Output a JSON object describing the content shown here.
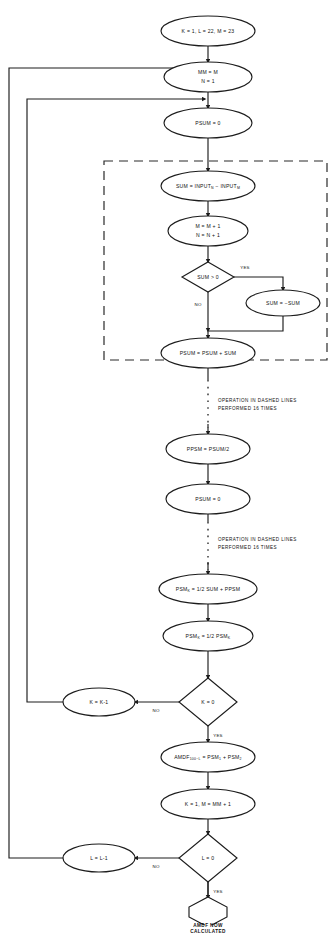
{
  "diagram": {
    "kind": "flowchart",
    "colors": {
      "stroke": "#1c1c1c",
      "fill": "#ffffff",
      "background": "#ffffff"
    },
    "nodes": {
      "init": {
        "shape": "ellipse",
        "line1": "K = 1,  L = 22,  M = 23"
      },
      "mm_set": {
        "shape": "ellipse",
        "line1": "MM = M",
        "line2": "N = 1"
      },
      "psum_zero_1": {
        "shape": "ellipse",
        "line1": "PSUM = 0"
      },
      "sum_input": {
        "shape": "ellipse",
        "pre": "SUM = INPUT",
        "sub1": "N",
        "mid": " − INPUT",
        "sub2": "M"
      },
      "incr": {
        "shape": "ellipse",
        "line1": "M = M + 1",
        "line2": "N = N + 1"
      },
      "sum_test": {
        "shape": "diamond",
        "line1": "SUM > 0"
      },
      "sum_neg": {
        "shape": "ellipse",
        "line1": "SUM = −SUM"
      },
      "psum_acc": {
        "shape": "ellipse",
        "line1": "PSUM = PSUM + SUM"
      },
      "ppsm": {
        "shape": "ellipse",
        "line1": "PPSM = PSUM/2"
      },
      "psum_zero_2": {
        "shape": "ellipse",
        "line1": "PSUM = 0"
      },
      "psm_k_calc": {
        "shape": "ellipse",
        "pre": "PSM",
        "sub1": "K",
        "mid": " = 1/2 SUM + PPSM"
      },
      "psm_k_half": {
        "shape": "ellipse",
        "pre": "PSM",
        "sub1": "K",
        "mid": " = 1/2  PSM",
        "sub2": "K"
      },
      "k_test": {
        "shape": "diamond",
        "line1": "K = 0"
      },
      "k_dec": {
        "shape": "ellipse",
        "line1": "K = K-1"
      },
      "amdf": {
        "shape": "ellipse",
        "pre": "AMDF",
        "sub1": "100−L",
        "mid": " = PSM",
        "sub2": "1",
        "mid2": " + PSM",
        "sub3": "2"
      },
      "k_reset": {
        "shape": "ellipse",
        "line1": "K = 1,   M = MM + 1"
      },
      "l_test": {
        "shape": "diamond",
        "line1": "L = 0"
      },
      "l_dec": {
        "shape": "ellipse",
        "line1": "L = L-1"
      },
      "terminator": {
        "shape": "hexagon",
        "line1": "AMDF  NOW",
        "line2": "CALCULATED"
      }
    },
    "edge_labels": {
      "yes_1": "YES",
      "no_1": "NO",
      "no_k": "NO",
      "yes_k": "YES",
      "no_l": "NO",
      "yes_l": "YES"
    },
    "annotations": {
      "note_1_line1": "OPERATION  IN  DASHED  LINES",
      "note_1_line2": "PERFORMED  16  TIMES",
      "note_2_line1": "OPERATION  IN  DASHED  LINES",
      "note_2_line2": "PERFORMED  16  TIMES"
    }
  }
}
